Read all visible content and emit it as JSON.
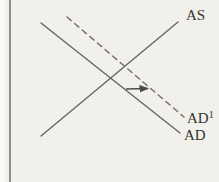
{
  "figure": {
    "kind": "economics-diagram",
    "colors": {
      "background": "#f1f0ea",
      "axis": "#908f8b",
      "curve": "#67655f",
      "dashed_curve": "#74716a",
      "arrow": "#4b4a45",
      "label": "#35342f"
    }
  },
  "diagram": {
    "type": "line",
    "axis": {
      "x": 10,
      "y_top": 0,
      "y_bottom": 182
    },
    "curves": [
      {
        "id": "AS",
        "label": "AS",
        "style": "solid",
        "x1": 41,
        "y1": 136,
        "x2": 178,
        "y2": 22,
        "label_x": 186,
        "label_y": 20
      },
      {
        "id": "AD",
        "label": "AD",
        "style": "solid",
        "x1": 41,
        "y1": 23,
        "x2": 180,
        "y2": 133,
        "label_x": 184,
        "label_y": 140
      },
      {
        "id": "AD1",
        "label_base": "AD",
        "label_sup": "1",
        "style": "dashed",
        "x1": 67,
        "y1": 17,
        "x2": 184,
        "y2": 117,
        "label_x": 187,
        "label_y": 123
      }
    ],
    "shift_arrow": {
      "direction": "right",
      "x1": 126,
      "y1": 89,
      "x2": 148,
      "y2": 88.5
    }
  }
}
